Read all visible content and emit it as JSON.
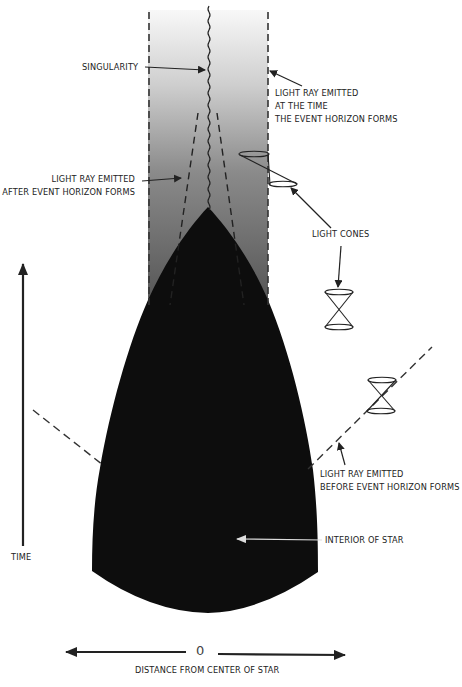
{
  "diagram": {
    "colors": {
      "star_interior": "#0d0d0d",
      "horizon_gradient_top": "#f7f7f7",
      "horizon_gradient_bottom": "#555555",
      "lines": "#222222",
      "text": "#222222"
    },
    "labels": {
      "singularity": "SINGULARITY",
      "ray_at_time": [
        "LIGHT RAY EMITTED",
        "AT THE TIME",
        "THE EVENT HORIZON FORMS"
      ],
      "ray_after": [
        "LIGHT RAY EMITTED",
        "AFTER EVENT HORIZON FORMS"
      ],
      "light_cones": "LIGHT CONES",
      "ray_before": [
        "LIGHT RAY EMITTED",
        "BEFORE EVENT HORIZON FORMS"
      ],
      "interior": "INTERIOR OF STAR",
      "time_axis": "TIME",
      "distance_axis": "DISTANCE FROM CENTER OF STAR",
      "origin": "0"
    },
    "elements": [
      "event-horizon-left-dashed",
      "event-horizon-right-dashed",
      "singularity-wavy-line",
      "collapsing-star-region",
      "light-ray-after-left",
      "light-ray-after-right",
      "light-ray-before",
      "light-cone-tilted-inside",
      "light-cone-upright-1",
      "light-cone-upright-2",
      "time-axis-arrow",
      "distance-axis-arrow"
    ]
  }
}
